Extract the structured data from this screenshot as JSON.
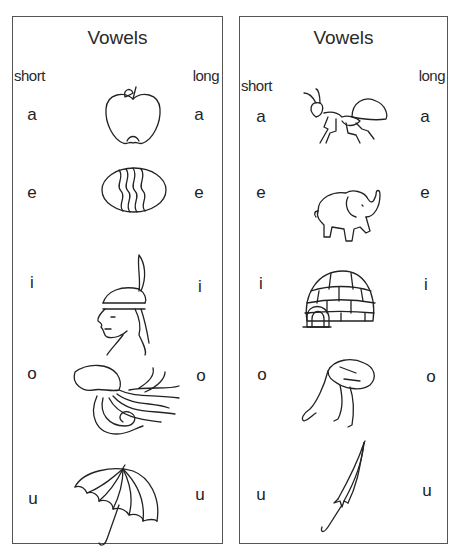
{
  "worksheets": [
    {
      "title": "Vowels",
      "short_label": "short",
      "long_label": "long",
      "rows": [
        {
          "short": "a",
          "long": "a",
          "picture": "apple"
        },
        {
          "short": "e",
          "long": "e",
          "picture": "egg"
        },
        {
          "short": "i",
          "long": "i",
          "picture": "indian"
        },
        {
          "short": "o",
          "long": "o",
          "picture": "octopus"
        },
        {
          "short": "u",
          "long": "u",
          "picture": "umbrella-open"
        }
      ]
    },
    {
      "title": "Vowels",
      "short_label": "short",
      "long_label": "long",
      "rows": [
        {
          "short": "a",
          "long": "a",
          "picture": "ant"
        },
        {
          "short": "e",
          "long": "e",
          "picture": "elephant"
        },
        {
          "short": "i",
          "long": "i",
          "picture": "igloo"
        },
        {
          "short": "o",
          "long": "o",
          "picture": "ostrich"
        },
        {
          "short": "u",
          "long": "u",
          "picture": "umbrella-closed"
        }
      ]
    }
  ],
  "colors": {
    "border": "#555555",
    "ink": "#222222",
    "background": "#ffffff"
  }
}
